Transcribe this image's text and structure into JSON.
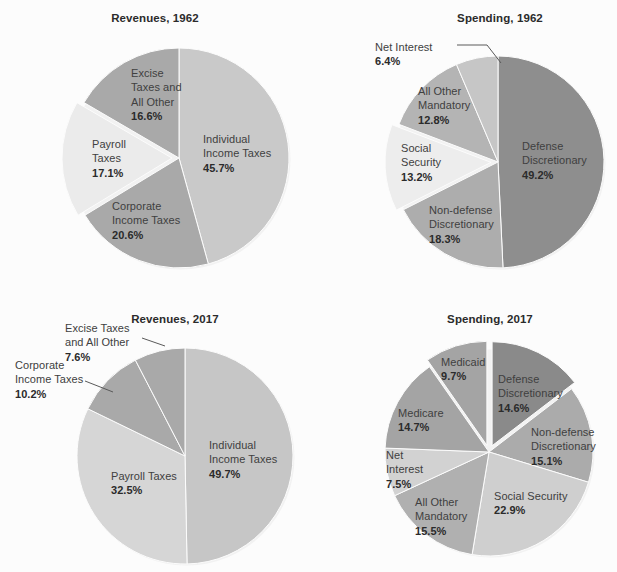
{
  "palette": {
    "background": "#fcfcfc",
    "text": "#404040",
    "text_bold": "#2b2b2b",
    "gray_darkest": "#7e7e7e",
    "gray_dark": "#9a9a9a",
    "gray_mid": "#a8a8a8",
    "gray_light": "#bdbdbd",
    "gray_lighter": "#c8c8c8",
    "gray_lightest": "#d8d8d8",
    "gray_near_white": "#e8e8e8",
    "leader_line": "#5a5a5a"
  },
  "chart_data": [
    {
      "type": "pie",
      "id": "revenues-1962",
      "title": "Revenues, 1962",
      "start_angle_deg": 0,
      "direction": "clockwise",
      "center": [
        179,
        158
      ],
      "radius": 110,
      "categories": [
        "Individual Income Taxes",
        "Corporate Income Taxes",
        "Payroll Taxes",
        "Excise Taxes and All Other"
      ],
      "values": [
        45.7,
        20.6,
        17.1,
        16.6
      ],
      "value_labels": [
        "45.7%",
        "20.6%",
        "17.1%",
        "16.6%"
      ],
      "colors": [
        "#c9c9c9",
        "#a9a9a9",
        "#ebebeb",
        "#a9a9a9"
      ],
      "exploded": [
        false,
        false,
        true,
        false
      ],
      "slices": [
        {
          "label": "Individual\nIncome Taxes",
          "pct": "45.7%",
          "label_x": 203,
          "label_y": 132,
          "align": "left",
          "has_leader": false
        },
        {
          "label": "Corporate\nIncome Taxes",
          "pct": "20.6%",
          "label_x": 112,
          "label_y": 199,
          "align": "left",
          "has_leader": false
        },
        {
          "label": "Payroll\nTaxes",
          "pct": "17.1%",
          "label_x": 92,
          "label_y": 137,
          "align": "left",
          "has_leader": false
        },
        {
          "label": "Excise\nTaxes and\nAll Other",
          "pct": "16.6%",
          "label_x": 131,
          "label_y": 66,
          "align": "left",
          "has_leader": false
        }
      ]
    },
    {
      "type": "pie",
      "id": "spending-1962",
      "title": "Spending, 1962",
      "start_angle_deg": 0,
      "direction": "clockwise",
      "center": [
        498,
        162
      ],
      "radius": 106,
      "categories": [
        "Defense Discretionary",
        "Non-defense Discretionary",
        "Social Security",
        "All Other Mandatory",
        "Net Interest"
      ],
      "values": [
        49.2,
        18.3,
        13.2,
        12.8,
        6.4
      ],
      "value_labels": [
        "49.2%",
        "18.3%",
        "13.2%",
        "12.8%",
        "6.4%"
      ],
      "colors": [
        "#8e8e8e",
        "#adadad",
        "#ededed",
        "#b4b4b4",
        "#c6c6c6"
      ],
      "exploded": [
        false,
        false,
        true,
        false,
        false
      ],
      "slices": [
        {
          "label": "Defense\nDiscretionary",
          "pct": "49.2%",
          "label_x": 522,
          "label_y": 139,
          "align": "left",
          "has_leader": false
        },
        {
          "label": "Non-defense\nDiscretionary",
          "pct": "18.3%",
          "label_x": 429,
          "label_y": 203,
          "align": "left",
          "has_leader": false
        },
        {
          "label": "Social\nSecurity",
          "pct": "13.2%",
          "label_x": 401,
          "label_y": 141,
          "align": "left",
          "has_leader": false
        },
        {
          "label": "All Other\nMandatory",
          "pct": "12.8%",
          "label_x": 418,
          "label_y": 84,
          "align": "left",
          "has_leader": false
        },
        {
          "label": "Net Interest",
          "pct": "6.4%",
          "label_x": 375,
          "label_y": 40,
          "align": "left",
          "has_leader": true,
          "leader": [
            [
              457,
              45
            ],
            [
              487,
              45
            ],
            [
              501,
              63
            ]
          ]
        }
      ]
    },
    {
      "type": "pie",
      "id": "revenues-2017",
      "title": "Revenues, 2017",
      "start_angle_deg": 0,
      "direction": "clockwise",
      "center": [
        185,
        456
      ],
      "radius": 108,
      "categories": [
        "Individual Income Taxes",
        "Payroll Taxes",
        "Corporate Income Taxes",
        "Excise Taxes and All Other"
      ],
      "values": [
        49.7,
        32.5,
        10.2,
        7.6
      ],
      "value_labels": [
        "49.7%",
        "32.5%",
        "10.2%",
        "7.6%"
      ],
      "colors": [
        "#c6c6c6",
        "#d6d6d6",
        "#a9a9a9",
        "#a9a9a9"
      ],
      "exploded": [
        false,
        false,
        false,
        false
      ],
      "slices": [
        {
          "label": "Individual\nIncome Taxes",
          "pct": "49.7%",
          "label_x": 209,
          "label_y": 438,
          "align": "left",
          "has_leader": false
        },
        {
          "label": "Payroll Taxes",
          "pct": "32.5%",
          "label_x": 111,
          "label_y": 469,
          "align": "left",
          "has_leader": false
        },
        {
          "label": "Corporate\nIncome Taxes",
          "pct": "10.2%",
          "label_x": 15,
          "label_y": 358,
          "align": "left",
          "has_leader": true,
          "leader": [
            [
              85,
              381
            ],
            [
              113,
              392
            ]
          ]
        },
        {
          "label": "Excise Taxes\nand All Other",
          "pct": "7.6%",
          "label_x": 65,
          "label_y": 321,
          "align": "left",
          "has_leader": true,
          "leader": [
            [
              142,
              338
            ],
            [
              165,
              346
            ]
          ]
        }
      ]
    },
    {
      "type": "pie",
      "id": "spending-2017",
      "title": "Spending, 2017",
      "start_angle_deg": 0,
      "direction": "clockwise",
      "center": [
        489,
        452
      ],
      "radius": 104,
      "categories": [
        "Defense Discretionary",
        "Non-defense Discretionary",
        "Social Security",
        "All Other Mandatory",
        "Net Interest",
        "Medicare",
        "Medicaid"
      ],
      "values": [
        14.6,
        15.1,
        22.9,
        15.5,
        7.5,
        14.7,
        9.7
      ],
      "value_labels": [
        "14.6%",
        "15.1%",
        "22.9%",
        "15.5%",
        "7.5%",
        "14.7%",
        "9.7%"
      ],
      "colors": [
        "#8a8a8a",
        "#ababab",
        "#cfcfcf",
        "#b0b0b0",
        "#d2d2d2",
        "#a4a4a4",
        "#a4a4a4"
      ],
      "exploded": [
        true,
        false,
        false,
        false,
        false,
        false,
        true
      ],
      "slices": [
        {
          "label": "Defense\nDiscretionary",
          "pct": "14.6%",
          "label_x": 498,
          "label_y": 372,
          "align": "left",
          "has_leader": false
        },
        {
          "label": "Non-defense\nDiscretionary",
          "pct": "15.1%",
          "label_x": 531,
          "label_y": 425,
          "align": "left",
          "has_leader": false
        },
        {
          "label": "Social Security",
          "pct": "22.9%",
          "label_x": 494,
          "label_y": 489,
          "align": "left",
          "has_leader": false
        },
        {
          "label": "All Other\nMandatory",
          "pct": "15.5%",
          "label_x": 415,
          "label_y": 495,
          "align": "left",
          "has_leader": false
        },
        {
          "label": "Net\nInterest",
          "pct": "7.5%",
          "label_x": 386,
          "label_y": 448,
          "align": "left",
          "has_leader": false
        },
        {
          "label": "Medicare",
          "pct": "14.7%",
          "label_x": 398,
          "label_y": 406,
          "align": "left",
          "has_leader": false
        },
        {
          "label": "Medicaid",
          "pct": "9.7%",
          "label_x": 441,
          "label_y": 355,
          "align": "left",
          "has_leader": false
        }
      ]
    }
  ],
  "titles": {
    "revenues_1962": "Revenues, 1962",
    "spending_1962": "Spending, 1962",
    "revenues_2017": "Revenues, 2017",
    "spending_2017": "Spending, 2017"
  },
  "background_text": {
    "line1": "",
    "line2": ""
  }
}
